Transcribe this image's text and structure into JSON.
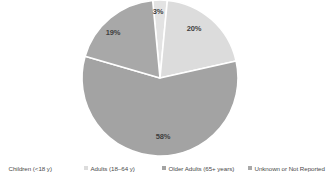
{
  "chart_data": {
    "type": "pie",
    "title": "",
    "categories": [
      "Children (<18 y)",
      "Adults (18–64 y)",
      "Older Adults (65+ years)",
      "Unknown or Not Reported"
    ],
    "values": [
      3,
      20,
      58,
      19
    ],
    "data_labels": [
      "3%",
      "20%",
      "58%",
      "19%"
    ],
    "unit": "percent",
    "colors": [
      "#e3e3e3",
      "#dcdcdc",
      "#a3a3a3",
      "#a8a8a8"
    ],
    "legend_position": "bottom",
    "grid": false,
    "separator_color": "#ffffff"
  },
  "pie": {
    "center_x": 160,
    "center_y": 78,
    "radius": 78,
    "slices": [
      {
        "name": "children",
        "label": "3%",
        "value": 3,
        "color": "#e3e3e3",
        "start_angle": -5.4,
        "end_angle": 5.4,
        "label_x": 158,
        "label_y": 11
      },
      {
        "name": "adults",
        "label": "20%",
        "value": 20,
        "color": "#dcdcdc",
        "start_angle": 5.4,
        "end_angle": 77.4,
        "label_x": 194,
        "label_y": 28
      },
      {
        "name": "older-adults",
        "label": "58%",
        "value": 58,
        "color": "#a3a3a3",
        "start_angle": 77.4,
        "end_angle": 286.2,
        "label_x": 163,
        "label_y": 136
      },
      {
        "name": "unknown",
        "label": "19%",
        "value": 19,
        "color": "#a8a8a8",
        "start_angle": 286.2,
        "end_angle": 354.6,
        "label_x": 113,
        "label_y": 32
      }
    ]
  },
  "legend": {
    "items": [
      {
        "label": "Children (<18 y)",
        "color": "#e3e3e3"
      },
      {
        "label": "Adults (18–64 y)",
        "color": "#dcdcdc"
      },
      {
        "label": "Older Adults (65+ years)",
        "color": "#a3a3a3"
      },
      {
        "label": "Unknown or Not Reported",
        "color": "#a8a8a8"
      }
    ]
  }
}
